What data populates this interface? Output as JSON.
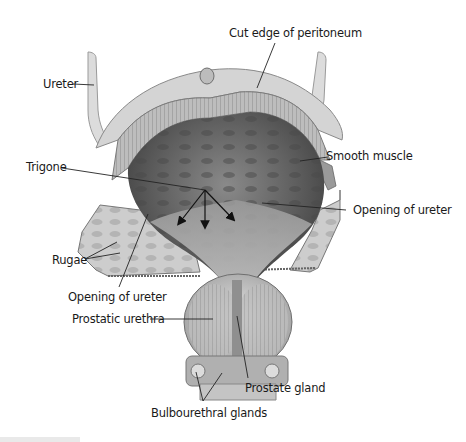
{
  "figure": {
    "colors": {
      "background": "#ffffff",
      "label_text": "#1a1a1a",
      "leader_line": "#222222",
      "tissue_light": "#d8d8d8",
      "tissue_mid": "#a9a9a9",
      "lumen_dark": "#5a5a5a",
      "arrow": "#111111"
    },
    "labels": [
      {
        "id": "cut-edge-of-peritoneum",
        "text": "Cut edge of peritoneum"
      },
      {
        "id": "ureter",
        "text": "Ureter"
      },
      {
        "id": "smooth-muscle",
        "text": "Smooth muscle"
      },
      {
        "id": "trigone",
        "text": "Trigone"
      },
      {
        "id": "opening-of-ureter-right",
        "text": "Opening of ureter"
      },
      {
        "id": "rugae",
        "text": "Rugae"
      },
      {
        "id": "opening-of-ureter-left",
        "text": "Opening of ureter"
      },
      {
        "id": "prostatic-urethra",
        "text": "Prostatic urethra"
      },
      {
        "id": "prostate-gland",
        "text": "Prostate gland"
      },
      {
        "id": "bulbourethral-glands",
        "text": "Bulbourethral glands"
      }
    ]
  }
}
